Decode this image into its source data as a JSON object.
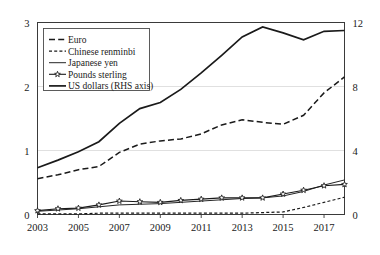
{
  "chart_data": {
    "type": "line",
    "title": "",
    "subtitle": "",
    "xlabel": "",
    "ylabel": "",
    "grid": true,
    "legend_position": "top-left",
    "x": [
      2003,
      2004,
      2005,
      2006,
      2007,
      2008,
      2009,
      2010,
      2011,
      2012,
      2013,
      2014,
      2015,
      2016,
      2017,
      2018
    ],
    "xticks": [
      "2003",
      "2005",
      "2007",
      "2009",
      "2011",
      "2013",
      "2015",
      "2017"
    ],
    "xtick_values": [
      2003,
      2005,
      2007,
      2009,
      2011,
      2013,
      2015,
      2017
    ],
    "xlim": [
      2003,
      2018
    ],
    "left_axis": {
      "ticks": [
        "0",
        "1",
        "2",
        "3"
      ],
      "tick_values": [
        0,
        1,
        2,
        3
      ],
      "ylim": [
        0,
        3
      ]
    },
    "right_axis": {
      "label_note": "RHS axis",
      "ticks": [
        "0",
        "4",
        "8",
        "12"
      ],
      "tick_values": [
        0,
        4,
        8,
        12
      ],
      "ylim": [
        0,
        12
      ]
    },
    "series": [
      {
        "name": "Euro",
        "key": "euro",
        "style": "dashed",
        "axis": "left",
        "marker": "none",
        "values": [
          0.56,
          0.62,
          0.7,
          0.75,
          0.97,
          1.1,
          1.15,
          1.18,
          1.26,
          1.4,
          1.48,
          1.44,
          1.41,
          1.55,
          1.9,
          2.15
        ]
      },
      {
        "name": "Chinese renminbi",
        "key": "chinese_renminbi",
        "style": "fine-dashed",
        "axis": "left",
        "marker": "none",
        "values": [
          0.01,
          0.01,
          0.01,
          0.02,
          0.02,
          0.02,
          0.02,
          0.02,
          0.02,
          0.02,
          0.02,
          0.03,
          0.04,
          0.11,
          0.19,
          0.27
        ]
      },
      {
        "name": "Japanese yen",
        "key": "japanese_yen",
        "style": "thin-solid",
        "axis": "left",
        "marker": "none",
        "values": [
          0.05,
          0.07,
          0.09,
          0.12,
          0.15,
          0.16,
          0.17,
          0.19,
          0.21,
          0.23,
          0.25,
          0.26,
          0.29,
          0.36,
          0.46,
          0.54
        ]
      },
      {
        "name": "Pounds sterling",
        "key": "pounds_sterling",
        "style": "solid-marker",
        "axis": "left",
        "marker": "star",
        "values": [
          0.06,
          0.09,
          0.1,
          0.15,
          0.21,
          0.2,
          0.19,
          0.22,
          0.24,
          0.26,
          0.26,
          0.26,
          0.32,
          0.38,
          0.45,
          0.47
        ]
      },
      {
        "name": "US dollars (RHS axis)",
        "key": "us_dollars",
        "style": "thick-solid",
        "axis": "right",
        "marker": "none",
        "values": [
          2.92,
          3.4,
          3.92,
          4.55,
          5.7,
          6.62,
          7.0,
          7.82,
          8.85,
          9.95,
          11.1,
          11.72,
          11.35,
          10.92,
          11.45,
          11.5
        ]
      }
    ],
    "legend": [
      {
        "label": "Euro",
        "style": "dashed"
      },
      {
        "label": "Chinese renminbi",
        "style": "fine-dashed"
      },
      {
        "label": "Japanese yen",
        "style": "thin-solid"
      },
      {
        "label": "Pounds sterling",
        "style": "solid-marker"
      },
      {
        "label": "US dollars (RHS axis)",
        "style": "thick-solid"
      }
    ],
    "colors": {
      "line": "#1a1a1a",
      "grid": "#d8d8d8",
      "frame": "#3a3a3a",
      "background": "#ffffff"
    }
  }
}
